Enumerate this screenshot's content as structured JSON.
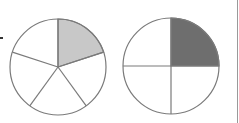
{
  "diagram": {
    "circles": [
      {
        "name": "fifths-circle",
        "parts": 5,
        "shaded_parts": 1,
        "fraction": "1/5",
        "center": [
          58,
          67
        ],
        "radius": 48,
        "shaded_color": "#c8c8c8"
      },
      {
        "name": "quarters-circle",
        "parts": 4,
        "shaded_parts": 1,
        "fraction": "1/4",
        "center": [
          171,
          66
        ],
        "radius": 48,
        "shaded_color": "#6e6e6e"
      }
    ],
    "stroke_color": "#7a7a7a",
    "background": "#ffffff"
  }
}
